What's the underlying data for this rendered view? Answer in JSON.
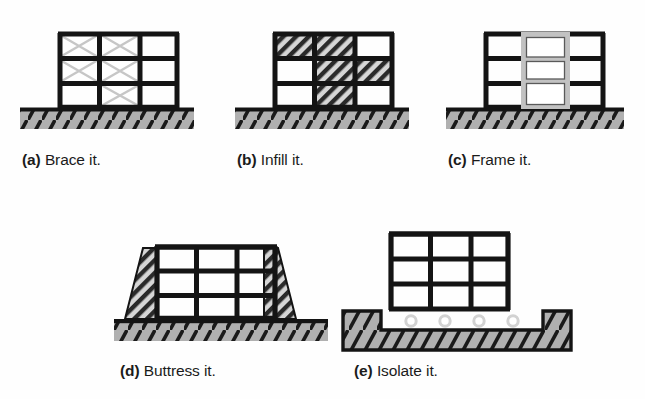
{
  "figure": {
    "background_color": "#fefefe",
    "line_color": "#111111",
    "ground_fill": "#b0b0b0",
    "hatch_fill": "#b3b3b3",
    "brace_color": "#c9c9c9",
    "frame_gray": "#c2c2c2",
    "panels": [
      {
        "id": "a",
        "tag": "(a)",
        "label": "Brace it.",
        "caption": "(a) Brace it.",
        "technique": "x-bracing",
        "bays": 3,
        "stories": 3,
        "braced_cells": [
          [
            true,
            true,
            false
          ],
          [
            true,
            true,
            false
          ],
          [
            false,
            true,
            false
          ]
        ]
      },
      {
        "id": "b",
        "tag": "(b)",
        "label": "Infill it.",
        "caption": "(b) Infill it.",
        "technique": "infill-walls",
        "bays": 3,
        "stories": 3,
        "infilled_cells": [
          [
            true,
            true,
            false
          ],
          [
            false,
            true,
            true
          ],
          [
            false,
            true,
            false
          ]
        ]
      },
      {
        "id": "c",
        "tag": "(c)",
        "label": "Frame it.",
        "caption": "(c) Frame it.",
        "technique": "moment-frame",
        "bays": 3,
        "stories": 3,
        "frame_bay_index": 1
      },
      {
        "id": "d",
        "tag": "(d)",
        "label": "Buttress it.",
        "caption": "(d) Buttress it.",
        "technique": "buttresses",
        "bays": 3,
        "stories": 3,
        "buttress_sides": [
          "left",
          "right"
        ]
      },
      {
        "id": "e",
        "tag": "(e)",
        "label": "Isolate it.",
        "caption": "(e) Isolate it.",
        "technique": "base-isolation",
        "bays": 3,
        "stories": 3,
        "isolator_count": 4
      }
    ]
  }
}
